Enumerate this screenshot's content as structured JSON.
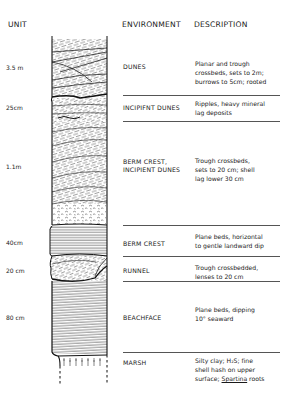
{
  "headers": {
    "unit": "UNIT",
    "environment": "ENVIRONMENT",
    "description": "DESCRIPTION"
  },
  "units": [
    {
      "thickness": "3.5 m",
      "environment": "DUNES",
      "environment_line2": "",
      "description": [
        "Planar and trough",
        "crossbeds, sets to 2m;",
        "burrows to 5cm; rooted"
      ],
      "pattern": "crossbedded"
    },
    {
      "thickness": "25cm",
      "environment": "INCIPIFNT DUNES",
      "environment_line2": "",
      "description": [
        "Ripples, heavy mineral",
        "lag deposits"
      ],
      "pattern": "rippled"
    },
    {
      "thickness": "1.1m",
      "environment": "BERM CREST,",
      "environment_line2": "INCIPIENT DUNES",
      "description": [
        "Trough crossbeds,",
        "sets to 20 cm; shell",
        "lag lower 30 cm"
      ],
      "pattern": "trough-crossbedded-with-shell-lag"
    },
    {
      "thickness": "40cm",
      "environment": "BERM CREST",
      "environment_line2": "",
      "description": [
        "Plane beds, horizontal",
        "to gentle landward dip"
      ],
      "pattern": "horizontal-laminae"
    },
    {
      "thickness": "20 cm",
      "environment": "RUNNEL",
      "environment_line2": "",
      "description": [
        "Trough crossbedded,",
        "lenses to 20 cm"
      ],
      "pattern": "trough-lenses"
    },
    {
      "thickness": "80 cm",
      "environment": "BEACHFACE",
      "environment_line2": "",
      "description": [
        "Plane beds, dipping",
        "10° seaward"
      ],
      "pattern": "seaward-dipping-laminae"
    },
    {
      "thickness": "",
      "environment": "MARSH",
      "environment_line2": "",
      "description": [
        "Silty clay; H₂S; fine",
        "shell hash on upper"
      ],
      "description_last_prefix": "surface; ",
      "description_last_italic": "Spartina",
      "description_last_suffix": " roots",
      "pattern": "roots"
    }
  ]
}
